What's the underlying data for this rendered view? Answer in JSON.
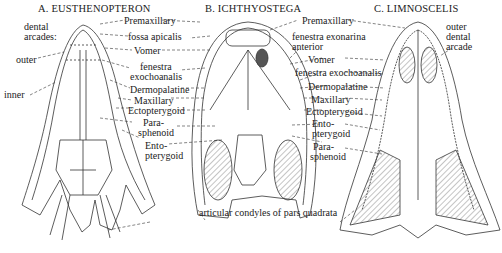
{
  "figure": {
    "panels": [
      {
        "id": "A",
        "title": "A. EUSTHENOPTERON"
      },
      {
        "id": "B",
        "title": "B. ICHTHYOSTEGA"
      },
      {
        "id": "C",
        "title": "C. LIMNOSCELIS"
      }
    ],
    "labels_left": {
      "dental_arcades_1": "dental",
      "dental_arcades_2": "arcades:",
      "outer": "outer",
      "inner": "inner"
    },
    "labels_middle_left": {
      "premaxillary": "Premaxillary",
      "fossa_apicalis": "fossa apicalis",
      "vomer": "Vomer",
      "fenestra_1": "fenestra",
      "fenestra_2": "exochoanalis",
      "dermopalatine": "Dermopalatine",
      "maxillary": "Maxillary",
      "ectopterygoid": "Ectopterygoid",
      "para_1": "Para-",
      "para_2": "sphenoid",
      "ento_1": "Ento-",
      "ento_2": "pterygoid"
    },
    "labels_middle_right": {
      "premaxillary": "Premaxillary",
      "fen_ant_1": "fenestra exonarina",
      "fen_ant_2": "anterior",
      "vomer": "Vomer",
      "fen_exo": "fenestra exochoanalis",
      "dermopalatine": "Dermopalatine",
      "maxillary": "Maxillary",
      "ectopterygoid": "Ectopterygoid",
      "ento_1": "Ento-",
      "ento_2": "pterygoid",
      "para_1": "Para-",
      "para_2": "sphenoid"
    },
    "labels_right": {
      "outer_1": "outer",
      "outer_2": "dental",
      "outer_3": "arcade"
    },
    "bottom_caption": "articular condyles of pars quadrata"
  }
}
